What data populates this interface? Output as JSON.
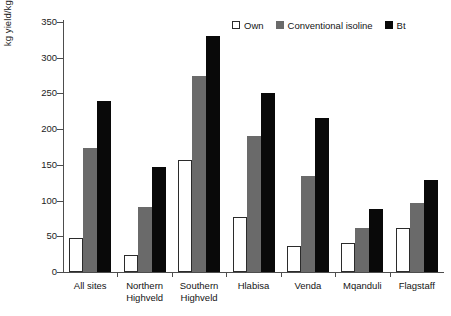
{
  "chart_data": {
    "type": "bar",
    "title": "",
    "xlabel": "",
    "ylabel": "kg yield/kg seed planted",
    "ylim": [
      0,
      350
    ],
    "yticks": [
      0,
      50,
      100,
      150,
      200,
      250,
      300,
      350
    ],
    "grid": false,
    "legend_position": "top-right",
    "categories": [
      "All sites",
      "Northern Highveld",
      "Southern Highveld",
      "Hlabisa",
      "Venda",
      "Mqanduli",
      "Flagstaff"
    ],
    "series": [
      {
        "name": "Own",
        "color": "#ffffff",
        "values": [
          48,
          24,
          157,
          77,
          37,
          41,
          61
        ]
      },
      {
        "name": "Conventional isoline",
        "color": "#6a6a6a",
        "values": [
          174,
          91,
          275,
          191,
          134,
          61,
          97
        ]
      },
      {
        "name": "Bt",
        "color": "#090909",
        "values": [
          240,
          147,
          331,
          251,
          215,
          88,
          129
        ]
      }
    ]
  },
  "axis": {
    "y_title": "kg yield/kg seed planted",
    "y_tick_labels": [
      "0",
      "50",
      "100",
      "150",
      "200",
      "250",
      "300",
      "350"
    ]
  },
  "legend": {
    "items": [
      {
        "label": "Own",
        "swatch": "own-swatch-icon"
      },
      {
        "label": "Conventional isoline",
        "swatch": "conventional-swatch-icon"
      },
      {
        "label": "Bt",
        "swatch": "bt-swatch-icon"
      }
    ]
  },
  "categories": [
    {
      "line1": "All sites",
      "line2": ""
    },
    {
      "line1": "Northern",
      "line2": "Highveld"
    },
    {
      "line1": "Southern",
      "line2": "Highveld"
    },
    {
      "line1": "Hlabisa",
      "line2": ""
    },
    {
      "line1": "Venda",
      "line2": ""
    },
    {
      "line1": "Mqanduli",
      "line2": ""
    },
    {
      "line1": "Flagstaff",
      "line2": ""
    }
  ]
}
